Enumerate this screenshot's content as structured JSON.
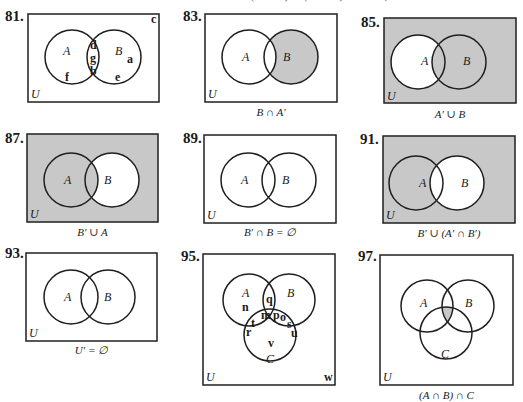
{
  "page": {
    "top_cutoff_text": "(A ∩ B)   ∩ (A ∪ B)   218   Yes, 6"
  },
  "colors": {
    "shade": "#c8c8c8",
    "line": "#1f1f1f",
    "background": "#ffffff"
  },
  "exercises": [
    {
      "number": "81.",
      "caption": "",
      "universe_label": "U",
      "set_labels": [
        "A",
        "B"
      ],
      "elements": {
        "A_only": [
          "f"
        ],
        "A_and_B": [
          "d",
          "g",
          "b"
        ],
        "B_only": [
          "a",
          "e"
        ],
        "outside": [
          "c"
        ]
      }
    },
    {
      "number": "83.",
      "caption": "B ∩ A′",
      "universe_label": "U",
      "set_labels": [
        "A",
        "B"
      ],
      "shaded": "B only"
    },
    {
      "number": "85.",
      "caption": "A′ ∪ B",
      "universe_label": "U",
      "set_labels": [
        "A",
        "B"
      ],
      "shaded": "all except A only"
    },
    {
      "number": "87.",
      "caption": "B′ ∪ A",
      "universe_label": "U",
      "set_labels": [
        "A",
        "B"
      ],
      "shaded": "all except B only"
    },
    {
      "number": "89.",
      "caption": "B′ ∩ B = ∅",
      "universe_label": "U",
      "set_labels": [
        "A",
        "B"
      ],
      "shaded": "none"
    },
    {
      "number": "91.",
      "caption": "B′ ∪ (A′ ∩ B′)",
      "universe_label": "U",
      "set_labels": [
        "A",
        "B"
      ],
      "shaded": "all except B"
    },
    {
      "number": "93.",
      "caption": "U′ = ∅",
      "universe_label": "U",
      "set_labels": [
        "A",
        "B"
      ],
      "shaded": "none"
    },
    {
      "number": "95.",
      "caption": "",
      "universe_label": "U",
      "set_labels": [
        "A",
        "B",
        "C"
      ],
      "elements": {
        "A_only": [
          "n"
        ],
        "A_B_only": [
          "q"
        ],
        "B_only": [],
        "A_C_only": [
          "r",
          "t"
        ],
        "A_B_C": [
          "m",
          "p"
        ],
        "B_C_only": [
          "o",
          "s",
          "u"
        ],
        "C_only": [
          "v"
        ],
        "outside": [
          "w"
        ]
      }
    },
    {
      "number": "97.",
      "caption": "(A ∩ B) ∩ C",
      "universe_label": "U",
      "set_labels": [
        "A",
        "B",
        "C"
      ],
      "shaded": "A ∩ B ∩ C"
    }
  ]
}
